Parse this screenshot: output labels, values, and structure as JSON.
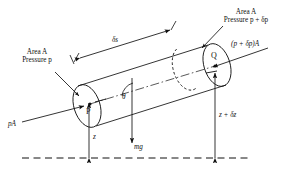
{
  "figure": {
    "background_color": "#ffffff",
    "stroke_color": "#111111"
  },
  "labels": {
    "area_left_line1": "Area A",
    "area_left_line2": "Pressure p",
    "area_right_line1": "Area A",
    "area_right_line2": "Pressure p + δp",
    "force_left": "pA",
    "force_right": "(p + δp)A",
    "length": "δs",
    "angle": "θ",
    "weight": "mg",
    "height_left": "z",
    "height_right": "z + δz",
    "point_p": "P",
    "point_q": "Q"
  },
  "elements": {
    "cylinder": "inclined-cylinder",
    "datum": "dashed-datum-line",
    "left_face": "left-end-ellipse",
    "right_face": "right-end-ellipse",
    "hidden_face": "dashed-hidden-ellipse",
    "axis": "dash-dot-centerline"
  }
}
